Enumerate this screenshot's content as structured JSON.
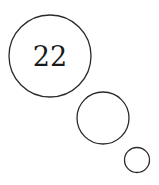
{
  "diagram": {
    "label": "22",
    "stroke_color": "#2a2a2a",
    "background": "#ffffff",
    "bubbles": [
      {
        "name": "large",
        "cx": 50,
        "cy": 56,
        "r": 41
      },
      {
        "name": "medium",
        "cx": 103,
        "cy": 118,
        "r": 26
      },
      {
        "name": "small",
        "cx": 137,
        "cy": 160,
        "r": 12.5
      }
    ]
  }
}
